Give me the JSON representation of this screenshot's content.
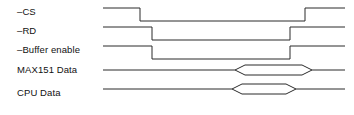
{
  "diagram": {
    "type": "digital-timing-diagram",
    "width": 354,
    "height": 115,
    "background_color": "#ffffff",
    "stroke_color": "#2b2b2b",
    "text_color": "#111111",
    "wave_start_x": 103,
    "wave_end_x": 345,
    "signals": [
      {
        "id": "cs",
        "label": "–CS",
        "active_low": true,
        "kind": "logic",
        "label_x": 17,
        "label_y": 12,
        "high_y": 8,
        "low_y": 21,
        "falling_edge_x": 140,
        "rising_edge_x": 305
      },
      {
        "id": "rd",
        "label": "–RD",
        "active_low": true,
        "kind": "logic",
        "label_x": 17,
        "label_y": 31,
        "high_y": 27,
        "low_y": 40,
        "falling_edge_x": 152,
        "rising_edge_x": 290
      },
      {
        "id": "buffer-enable",
        "label": "–Buffer enable",
        "active_low": true,
        "kind": "logic",
        "label_x": 17,
        "label_y": 50,
        "high_y": 46,
        "low_y": 59,
        "falling_edge_x": 152,
        "rising_edge_x": 290
      },
      {
        "id": "max151-data",
        "label": "MAX151 Data",
        "active_low": false,
        "kind": "bus",
        "label_x": 17,
        "label_y": 70,
        "center_y": 70,
        "half_height": 5,
        "bus_start_x": 235,
        "bus_end_x": 312,
        "bevel": 10
      },
      {
        "id": "cpu-data",
        "label": "CPU Data",
        "active_low": false,
        "kind": "bus",
        "label_x": 17,
        "label_y": 93,
        "center_y": 89,
        "half_height": 5,
        "bus_start_x": 232,
        "bus_end_x": 296,
        "bevel": 10
      }
    ]
  }
}
